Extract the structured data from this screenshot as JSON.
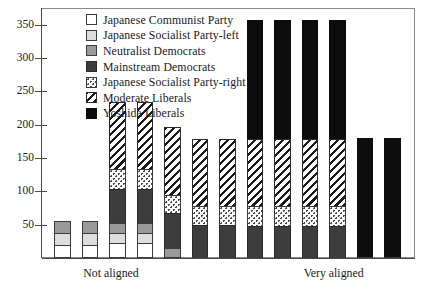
{
  "chart_data": {
    "type": "bar",
    "subtype": "stacked-vertical",
    "title": "",
    "xlabel": "",
    "ylabel": "",
    "ylim": [
      0,
      375
    ],
    "yticks": [
      50,
      100,
      150,
      200,
      250,
      300,
      350
    ],
    "ytick_labels": [
      "50",
      "100",
      "150",
      "200",
      "250",
      "300",
      "350"
    ],
    "grid": false,
    "legend_position": "inside-top-left",
    "x_axis_annotations": [
      {
        "label": "Not aligned",
        "at_category_index": 2
      },
      {
        "label": "Very aligned",
        "at_category_index": 10
      }
    ],
    "categories": [
      "1",
      "2",
      "3",
      "4",
      "5",
      "6",
      "7",
      "8",
      "9",
      "10",
      "11",
      "12",
      "13"
    ],
    "series": [
      {
        "name": "Japanese Communist Party",
        "color": "#ffffff",
        "pattern": "solid-white-outline",
        "values": [
          20,
          20,
          22,
          22,
          0,
          0,
          0,
          0,
          0,
          0,
          0,
          0,
          0
        ]
      },
      {
        "name": "Japanese Socialist Party-left",
        "color": "#dddddd",
        "pattern": "solid-light-gray",
        "values": [
          18,
          18,
          16,
          16,
          0,
          0,
          0,
          0,
          0,
          0,
          0,
          0,
          0
        ]
      },
      {
        "name": "Neutralist Democrats",
        "color": "#9a9a9a",
        "pattern": "solid-mid-gray",
        "values": [
          17,
          17,
          14,
          14,
          15,
          0,
          0,
          0,
          0,
          0,
          0,
          0,
          0
        ]
      },
      {
        "name": "Mainstream Democrats",
        "color": "#3d3d3d",
        "pattern": "solid-dark-gray",
        "values": [
          0,
          0,
          52,
          52,
          52,
          50,
          50,
          48,
          48,
          48,
          48,
          0,
          0
        ]
      },
      {
        "name": "Japanese Socialist Party-right",
        "color": "#ffffff",
        "pattern": "dotted",
        "values": [
          0,
          0,
          30,
          30,
          27,
          28,
          28,
          30,
          30,
          30,
          30,
          0,
          0
        ]
      },
      {
        "name": "Moderate Liberals",
        "color": "#ffffff",
        "pattern": "diagonal-hatch",
        "values": [
          0,
          0,
          100,
          100,
          102,
          100,
          100,
          100,
          100,
          100,
          100,
          0,
          0
        ]
      },
      {
        "name": "Yoshida Liberals",
        "color": "#0d0d0d",
        "pattern": "solid-black",
        "values": [
          0,
          0,
          0,
          0,
          0,
          0,
          0,
          179,
          179,
          179,
          179,
          180,
          180
        ]
      }
    ],
    "totals": [
      55,
      55,
      234,
      234,
      196,
      178,
      178,
      357,
      357,
      357,
      357,
      180,
      180
    ]
  },
  "legend": {
    "items": [
      {
        "label": "Japanese Communist Party",
        "swatch": "sw-jcp"
      },
      {
        "label": "Japanese Socialist Party-left",
        "swatch": "sw-jspl"
      },
      {
        "label": "Neutralist Democrats",
        "swatch": "sw-neu"
      },
      {
        "label": "Mainstream Democrats",
        "swatch": "sw-main"
      },
      {
        "label": "Japanese Socialist Party-right",
        "swatch": "sw-jspr"
      },
      {
        "label": "Moderate Liberals",
        "swatch": "sw-mod"
      },
      {
        "label": "Yoshida Liberals",
        "swatch": "sw-yosh"
      }
    ]
  }
}
